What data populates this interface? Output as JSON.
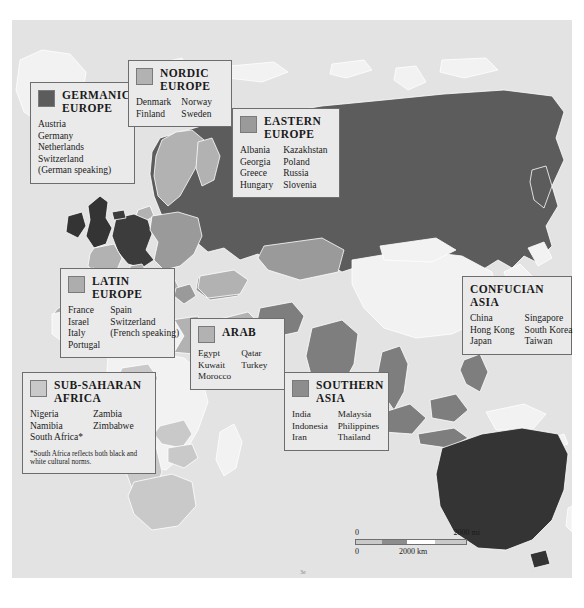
{
  "map": {
    "title": "World cultural clusters map",
    "background_color": "#e3e3e3",
    "land_unassigned_color": "#f2f2f2",
    "watermark": ""
  },
  "legend_boxes": [
    {
      "id": "germanic",
      "title": "GERMANIC\nEUROPE",
      "swatch_color": "#5c5c5c",
      "has_swatch": true,
      "columns": [
        [
          "Austria",
          "Germany",
          "Netherlands",
          "Switzerland",
          "(German speaking)"
        ]
      ],
      "footnote": ""
    },
    {
      "id": "nordic",
      "title": "NORDIC\nEUROPE",
      "swatch_color": "#b2b2b2",
      "has_swatch": true,
      "columns": [
        [
          "Denmark",
          "Finland"
        ],
        [
          "Norway",
          "Sweden"
        ]
      ],
      "footnote": ""
    },
    {
      "id": "eastern",
      "title": "EASTERN\nEUROPE",
      "swatch_color": "#9a9a9a",
      "has_swatch": true,
      "columns": [
        [
          "Albania",
          "Georgia",
          "Greece",
          "Hungary"
        ],
        [
          "Kazakhstan",
          "Poland",
          "Russia",
          "Slovenia"
        ]
      ],
      "footnote": ""
    },
    {
      "id": "latin",
      "title": "LATIN\nEUROPE",
      "swatch_color": "#adadad",
      "has_swatch": true,
      "columns": [
        [
          "France",
          "Israel",
          "Italy",
          "Portugal"
        ],
        [
          "Spain",
          "Switzerland",
          "(French speaking)"
        ]
      ],
      "footnote": ""
    },
    {
      "id": "arab",
      "title": "ARAB",
      "swatch_color": "#b2b2b2",
      "has_swatch": true,
      "columns": [
        [
          "Egypt",
          "Kuwait",
          "Morocco"
        ],
        [
          "Qatar",
          "Turkey"
        ]
      ],
      "footnote": ""
    },
    {
      "id": "subsaharan",
      "title": "SUB-SAHARAN\nAFRICA",
      "swatch_color": "#c9c9c9",
      "has_swatch": true,
      "columns": [
        [
          "Nigeria",
          "Namibia",
          "South Africa*"
        ],
        [
          "Zambia",
          "Zimbabwe"
        ]
      ],
      "footnote": "*South Africa reflects both black and white cultural norms."
    },
    {
      "id": "southern",
      "title": "SOUTHERN\nASIA",
      "swatch_color": "#8d8d8d",
      "has_swatch": true,
      "columns": [
        [
          "India",
          "Indonesia",
          "Iran"
        ],
        [
          "Malaysia",
          "Philippines",
          "Thailand"
        ]
      ],
      "footnote": ""
    },
    {
      "id": "confucian",
      "title": "CONFUCIAN\nASIA",
      "swatch_color": "",
      "has_swatch": false,
      "columns": [
        [
          "China",
          "Hong Kong",
          "Japan"
        ],
        [
          "Singapore",
          "South Korea",
          "Taiwan"
        ]
      ],
      "footnote": ""
    }
  ],
  "scale_bar": {
    "miles_zero": "0",
    "miles_max": "2000 mi",
    "km_zero": "0",
    "km_max": "2000 km"
  },
  "colors": {
    "ocean": "#e3e3e3",
    "box_fill": "#eaeaea",
    "box_border": "#6d6d6d",
    "very_dark_land": "#343434",
    "text": "#1a1a1a"
  }
}
